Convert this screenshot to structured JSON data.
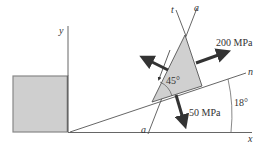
{
  "diagram": {
    "axes": {
      "x_label": "x",
      "y_label": "y",
      "n_label": "n",
      "t_label": "t"
    },
    "plane": {
      "label_top": "a",
      "label_bottom": "a"
    },
    "element": {
      "angle_label": "45°"
    },
    "stresses": {
      "normal_stress": "200 MPa",
      "shear_stress": "50 MPa"
    },
    "rotation_angle": "18°",
    "colors": {
      "element_fill": "#d0d0d0",
      "square_fill": "#cfcfcf",
      "line": "#444444",
      "arrow": "#333333"
    }
  }
}
